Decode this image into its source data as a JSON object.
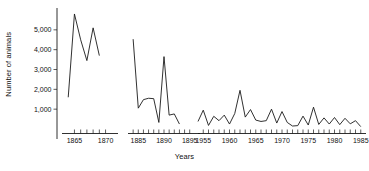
{
  "chart_data": {
    "type": "line",
    "title": "",
    "xlabel": "Years",
    "ylabel": "Number of animals",
    "ylim": [
      0,
      6000
    ],
    "yticks": [
      1000,
      2000,
      3000,
      4000,
      5000
    ],
    "ytick_labels": [
      "1,000",
      "2,000",
      "3,000",
      "4,000",
      "5,000"
    ],
    "grid": false,
    "legend": null,
    "broken_axis": true,
    "note": "Three discontinuous x-axis segments (panels) sharing one y-axis; population of animals declines across eras.",
    "panels": [
      {
        "name": "panel-1860s",
        "xlim": [
          1863,
          1872
        ],
        "xtick_labels": [
          "1865",
          "1870"
        ],
        "xtick_values": [
          1865,
          1870
        ],
        "minor_ticks": [
          1865,
          1866,
          1867,
          1868,
          1869,
          1870
        ],
        "x": [
          1864,
          1865,
          1866,
          1867,
          1868,
          1869
        ],
        "values": [
          1600,
          5800,
          4500,
          3450,
          5100,
          3700
        ]
      },
      {
        "name": "panel-1880s-90s",
        "xlim": [
          1883,
          1897
        ],
        "xtick_labels": [
          "1885",
          "1890",
          "1895"
        ],
        "xtick_values": [
          1885,
          1890,
          1895
        ],
        "minor_ticks": [
          1884,
          1885,
          1886,
          1887,
          1888,
          1889,
          1890,
          1891,
          1892,
          1893,
          1894,
          1895
        ],
        "x": [
          1884,
          1885,
          1886,
          1887,
          1888,
          1889,
          1890,
          1891,
          1892,
          1893
        ],
        "values": [
          4530,
          1050,
          1480,
          1550,
          1530,
          330,
          3650,
          700,
          760,
          250
        ]
      },
      {
        "name": "panel-1955-1985",
        "xlim": [
          1954,
          1986
        ],
        "xtick_labels": [
          "1955",
          "1960",
          "1965",
          "1970",
          "1975",
          "1980",
          "1985"
        ],
        "xtick_values": [
          1955,
          1960,
          1965,
          1970,
          1975,
          1980,
          1985
        ],
        "minor_ticks": [
          1955,
          1956,
          1957,
          1958,
          1959,
          1960,
          1961,
          1962,
          1963,
          1964,
          1965,
          1966,
          1967,
          1968,
          1969,
          1970,
          1971,
          1972,
          1973,
          1974,
          1975,
          1976,
          1977,
          1978,
          1979,
          1980,
          1981,
          1982,
          1983,
          1984,
          1985
        ],
        "x": [
          1954,
          1955,
          1956,
          1957,
          1958,
          1959,
          1960,
          1961,
          1962,
          1963,
          1964,
          1965,
          1966,
          1967,
          1968,
          1969,
          1970,
          1971,
          1972,
          1973,
          1974,
          1975,
          1976,
          1977,
          1978,
          1979,
          1980,
          1981,
          1982,
          1983,
          1984,
          1985
        ],
        "values": [
          380,
          950,
          180,
          640,
          420,
          700,
          250,
          780,
          1950,
          600,
          980,
          450,
          380,
          420,
          1000,
          300,
          880,
          330,
          150,
          170,
          650,
          200,
          1100,
          230,
          560,
          250,
          580,
          220,
          540,
          260,
          420,
          120
        ]
      }
    ]
  },
  "axis": {
    "y_title": "Number of animals",
    "x_title": "Years"
  },
  "colors": {
    "line": "#1a1a1a",
    "axis": "#1a1a1a",
    "background": "#ffffff"
  }
}
